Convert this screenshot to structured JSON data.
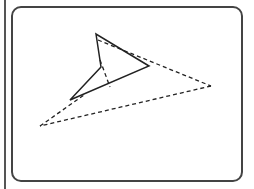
{
  "figure": {
    "type": "geometric-diagram",
    "colors": {
      "stroke": "#222222",
      "frame": "#444444",
      "background": "#ffffff"
    },
    "solid_polygon": [
      [
        96,
        34
      ],
      [
        101,
        67
      ],
      [
        70,
        100
      ],
      [
        149,
        66
      ]
    ],
    "dashed_segments": [
      [
        [
          98,
          40
        ],
        [
          211,
          86
        ]
      ],
      [
        [
          211,
          86
        ],
        [
          40,
          126
        ]
      ],
      [
        [
          40,
          126
        ],
        [
          84,
          95
        ]
      ],
      [
        [
          100,
          60
        ],
        [
          110,
          87
        ]
      ]
    ]
  }
}
